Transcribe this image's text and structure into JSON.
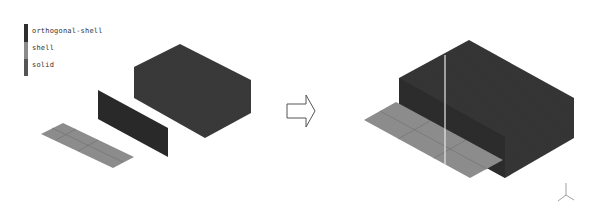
{
  "legend": {
    "items": [
      {
        "label": "orthogonal-shell",
        "color": "#2e2e2e"
      },
      {
        "label": "shell",
        "color": "#8a8a8a"
      },
      {
        "label": "solid",
        "color": "#555555"
      }
    ]
  },
  "colors": {
    "solid_top": "#3d3d3d",
    "solid_side": "#363636",
    "orthogonal_shell": "#2a2a2a",
    "shell": "#8c8c8c",
    "shell_lines": "#6e6e6e",
    "seam_line": "#e8e8e8",
    "arrow_stroke": "#555555"
  },
  "before": {
    "solid_box": "solid",
    "vertical_plate": "orthogonal-shell",
    "flat_plate": "shell"
  },
  "transition_arrow": "right-arrow-outline",
  "after": {
    "assembly": "solid + orthogonal-shell + shell merged"
  },
  "axis_triad": "xyz-axis-icon"
}
